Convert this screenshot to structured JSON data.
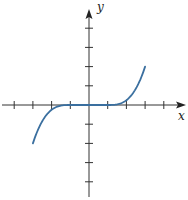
{
  "chart_data": {
    "type": "line",
    "title": "",
    "xlabel": "x",
    "ylabel": "y",
    "xlim": [
      -4.5,
      5
    ],
    "ylim": [
      -5,
      5
    ],
    "x_ticks": [
      -4,
      -3,
      -2,
      -1,
      1,
      2,
      3,
      4
    ],
    "y_ticks": [
      -4,
      -3,
      -2,
      -1,
      1,
      2,
      3,
      4
    ],
    "tick_labels": false,
    "grid": false,
    "legend": null,
    "series": [
      {
        "name": "f(x)",
        "color": "#3a6f9f",
        "x": [
          -3,
          -2.5,
          -2,
          -1.5,
          -1,
          0,
          1,
          1.5,
          2,
          2.5,
          3
        ],
        "y": [
          -2,
          -1.55,
          -0.9,
          -0.3,
          0,
          0,
          0,
          0.3,
          0.9,
          1.55,
          2
        ]
      }
    ]
  },
  "colors": {
    "axis": "#333333",
    "curve": "#3a6f9f",
    "background": "#ffffff"
  }
}
